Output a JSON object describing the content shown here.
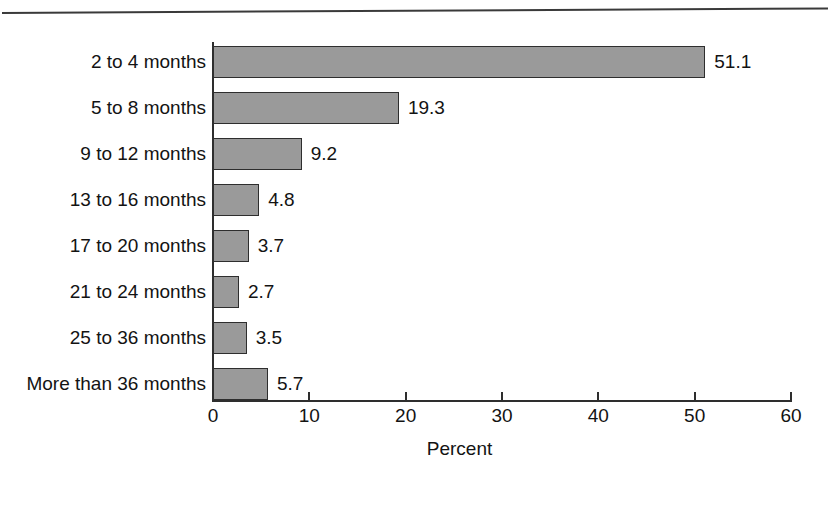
{
  "figure": {
    "caption_fragment": "Figure",
    "rule_color": "#3a3a3a"
  },
  "chart_data": {
    "type": "bar",
    "orientation": "horizontal",
    "title": "",
    "subtitle": "",
    "xlabel": "Percent",
    "ylabel": "",
    "categories": [
      "2 to 4 months",
      "5 to 8 months",
      "9 to 12 months",
      "13 to 16 months",
      "17 to 20 months",
      "21 to 24 months",
      "25 to 36 months",
      "More than 36 months"
    ],
    "values": [
      51.1,
      19.3,
      9.2,
      4.8,
      3.7,
      2.7,
      3.5,
      5.7
    ],
    "data_labels": [
      "51.1",
      "19.3",
      "9.2",
      "4.8",
      "3.7",
      "2.7",
      "3.5",
      "5.7"
    ],
    "xlim": [
      0,
      60
    ],
    "xticks": [
      0,
      10,
      20,
      30,
      40,
      50,
      60
    ],
    "xtick_labels": [
      "0",
      "10",
      "20",
      "30",
      "40",
      "50",
      "60"
    ],
    "grid": false,
    "legend": false,
    "bar_fill_color": "#9a9a9a",
    "bar_border_color": "#2e2e2e",
    "axis_color": "#2e2e2e",
    "text_color": "#131313"
  }
}
